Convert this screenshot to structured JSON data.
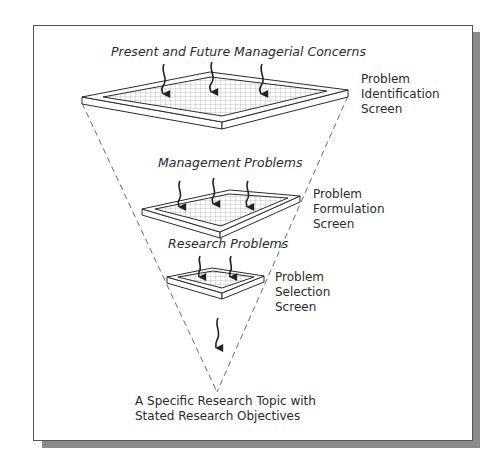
{
  "diagram": {
    "type": "funnel-of-screens",
    "inputs": {
      "top": "Present and Future Managerial Concerns",
      "middle": "Management Problems",
      "bottom": "Research Problems"
    },
    "screens": [
      {
        "id": "identification",
        "line1": "Problem",
        "line2": "Identification",
        "line3": "Screen"
      },
      {
        "id": "formulation",
        "line1": "Problem",
        "line2": "Formulation",
        "line3": "Screen"
      },
      {
        "id": "selection",
        "line1": "Problem",
        "line2": "Selection",
        "line3": "Screen"
      }
    ],
    "output": {
      "line1": "A Specific Research Topic with",
      "line2": "Stated Research Objectives"
    },
    "colors": {
      "line": "#2a2a2a",
      "grid": "#9a9a9a",
      "shadow": "#8a8a8a",
      "background": "#ffffff"
    }
  }
}
